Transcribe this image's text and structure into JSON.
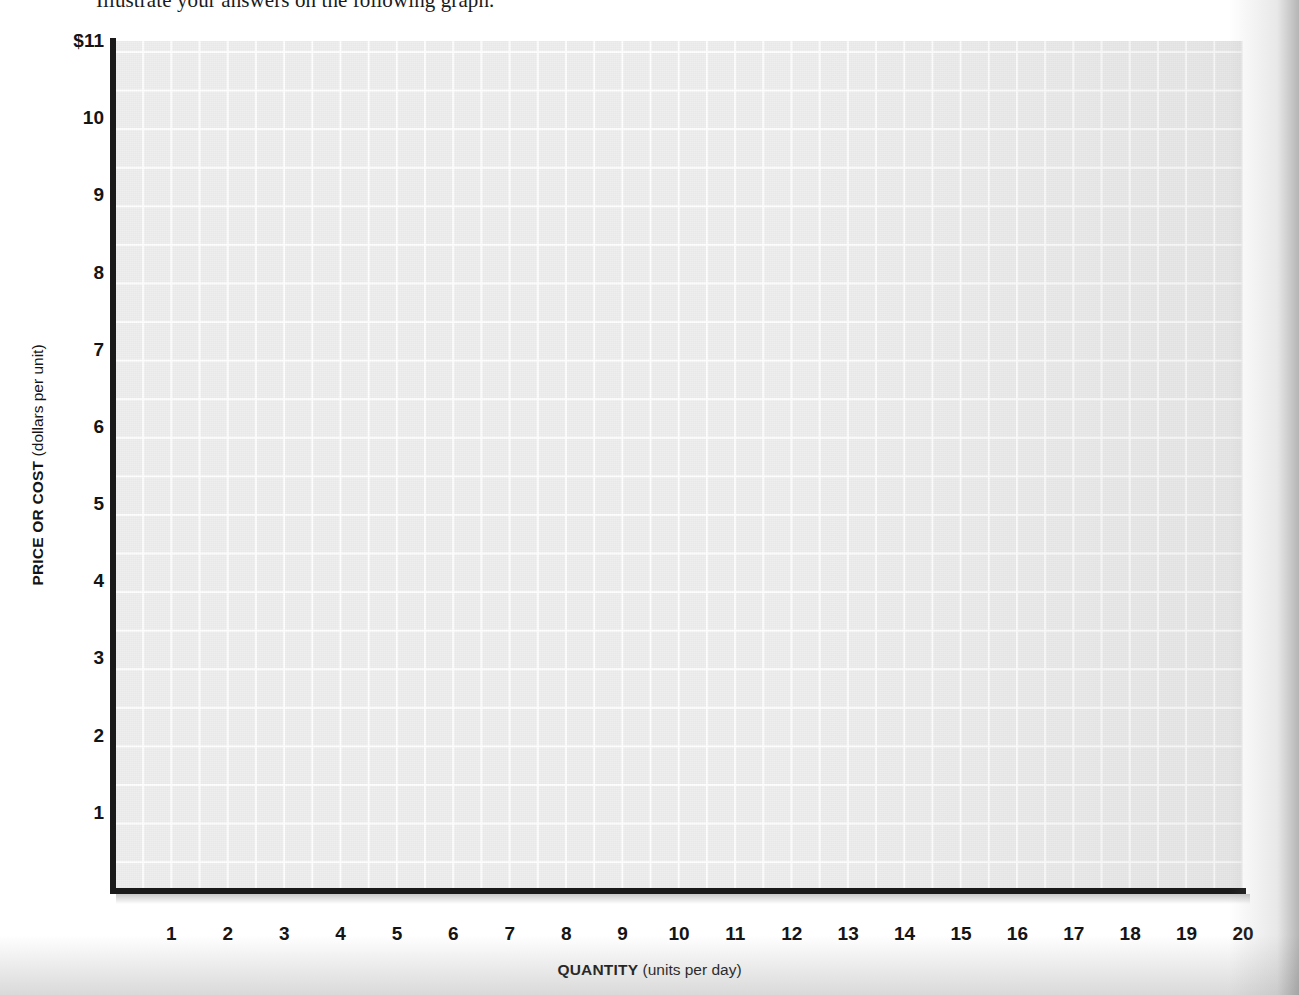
{
  "instruction": {
    "text": "Illustrate your answers on the following graph."
  },
  "chart_data": {
    "type": "grid",
    "title": "",
    "subtitle": "",
    "xlabel_bold": "QUANTITY",
    "xlabel_note": "(units per day)",
    "ylabel_bold": "PRICE OR COST",
    "ylabel_note": "(dollars per unit)",
    "x_tick_labels": [
      "1",
      "2",
      "3",
      "4",
      "5",
      "6",
      "7",
      "8",
      "9",
      "10",
      "11",
      "12",
      "13",
      "14",
      "15",
      "16",
      "17",
      "18",
      "19",
      "20"
    ],
    "x_tick_values": [
      1,
      2,
      3,
      4,
      5,
      6,
      7,
      8,
      9,
      10,
      11,
      12,
      13,
      14,
      15,
      16,
      17,
      18,
      19,
      20
    ],
    "y_tick_labels": [
      "$11",
      "10",
      "9",
      "8",
      "7",
      "6",
      "5",
      "4",
      "3",
      "2",
      "1"
    ],
    "y_tick_values": [
      11,
      10,
      9,
      8,
      7,
      6,
      5,
      4,
      3,
      2,
      1
    ],
    "xlim": [
      0,
      20
    ],
    "ylim": [
      0,
      11
    ],
    "x_major_step": 1,
    "y_major_step": 1,
    "x_minor_step": 0.5,
    "y_minor_step": 0.5,
    "grid": true,
    "legend": null,
    "series": [],
    "annotations": [],
    "plot_background_color": "#eeeeee",
    "gridline_color": "#ffffff",
    "axis_color": "#1a1a1a",
    "page_background_color": "#ffffff"
  }
}
